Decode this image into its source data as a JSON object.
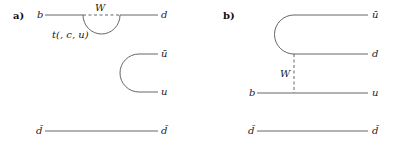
{
  "diagrams": [
    {
      "panel_label": "a)",
      "lines": {
        "top_left": "b",
        "top_right": "d",
        "boson": "W",
        "loop": "t(, c, u)",
        "mid_top_right": "ū",
        "mid_bottom_right": "u",
        "bottom_left": "d̄",
        "bottom_right": "d̄"
      }
    },
    {
      "panel_label": "b)",
      "lines": {
        "top_right": "ū",
        "upper_right": "d",
        "boson": "W",
        "mid_left": "b",
        "mid_right": "u",
        "bottom_left": "d̄",
        "bottom_right": "d̄"
      }
    }
  ]
}
